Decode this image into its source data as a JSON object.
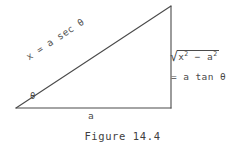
{
  "figure": {
    "caption": "Figure 14.4",
    "background_color": "#ffffff",
    "line_color": "#4a4a4a",
    "text_color": "#4a4a4a"
  },
  "diagram": {
    "type": "right-triangle",
    "vertices": {
      "left": [
        16,
        108
      ],
      "apex": [
        171,
        6
      ],
      "bottom_right": [
        171,
        108
      ]
    },
    "labels": {
      "hypotenuse": "x = a sec θ",
      "base": "a",
      "angle": "θ",
      "opposite_radical_prefix": "√",
      "opposite_radicand_first": "x",
      "opposite_radicand_first_exp": "2",
      "opposite_radicand_operator": " − ",
      "opposite_radicand_second": "a",
      "opposite_radicand_second_exp": "2",
      "opposite_equals": "= a tan θ"
    }
  }
}
